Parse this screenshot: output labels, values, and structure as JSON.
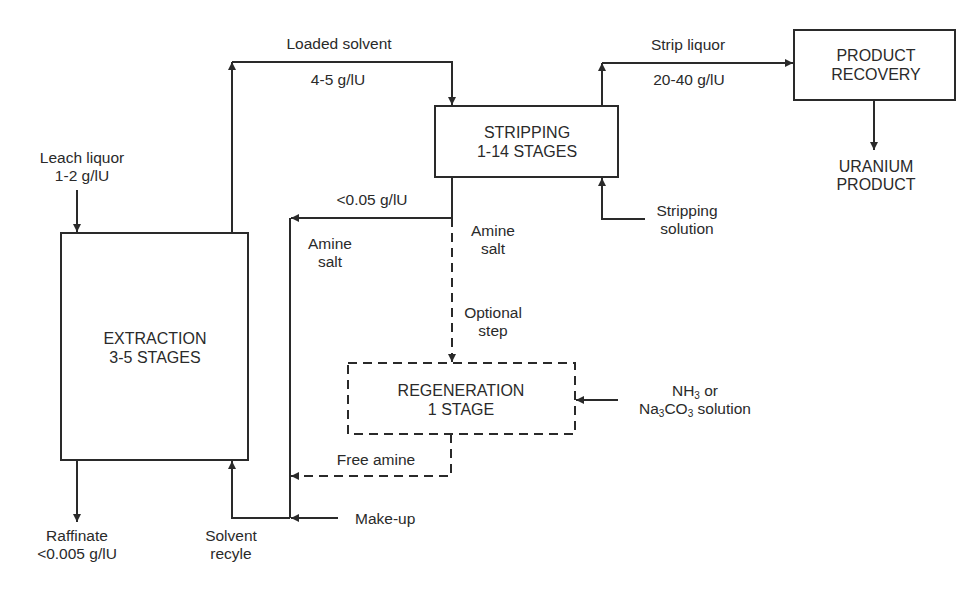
{
  "diagram": {
    "type": "process-flow",
    "colors": {
      "line": "#2a2a2a",
      "background": "#ffffff"
    }
  },
  "boxes": {
    "extraction": {
      "line1": "EXTRACTION",
      "line2": "3-5 STAGES",
      "style": "solid"
    },
    "stripping": {
      "line1": "STRIPPING",
      "line2": "1-14 STAGES",
      "style": "solid"
    },
    "product_recovery": {
      "line1": "PRODUCT",
      "line2": "RECOVERY",
      "style": "solid"
    },
    "regeneration": {
      "line1": "REGENERATION",
      "line2": "1 STAGE",
      "style": "dashed"
    }
  },
  "labels": {
    "leach_liquor": {
      "line1": "Leach liquor",
      "line2": "1-2 g/lU"
    },
    "loaded_solvent": {
      "name": "Loaded solvent",
      "conc": "4-5 g/lU"
    },
    "strip_liquor": {
      "name": "Strip liquor",
      "conc": "20-40 g/lU"
    },
    "uranium_product": {
      "line1": "URANIUM",
      "line2": "PRODUCT"
    },
    "stripping_solution": {
      "line1": "Stripping",
      "line2": "solution"
    },
    "barren_conc": "<0.05 g/lU",
    "amine_salt_left": {
      "line1": "Amine",
      "line2": "salt"
    },
    "amine_salt_right": {
      "line1": "Amine",
      "line2": "salt"
    },
    "optional_step": {
      "line1": "Optional",
      "line2": "step"
    },
    "regen_reagent": {
      "line1_main": "NH",
      "line1_sub": "3",
      "line1_tail": " or",
      "line2_a": "Na",
      "line2_sub1": "3",
      "line2_b": "CO",
      "line2_sub2": "3",
      "line2_tail": " solution"
    },
    "free_amine": "Free amine",
    "make_up": "Make-up",
    "raffinate": {
      "line1": "Raffinate",
      "line2": "<0.005 g/lU"
    },
    "solvent_recycle": {
      "line1": "Solvent",
      "line2": "recyle"
    }
  },
  "flows": [
    {
      "from": "Leach liquor",
      "to": "EXTRACTION",
      "style": "solid"
    },
    {
      "from": "EXTRACTION",
      "to": "STRIPPING",
      "label": "Loaded solvent 4-5 g/lU",
      "style": "solid"
    },
    {
      "from": "STRIPPING",
      "to": "PRODUCT RECOVERY",
      "label": "Strip liquor 20-40 g/lU",
      "style": "solid"
    },
    {
      "from": "PRODUCT RECOVERY",
      "to": "URANIUM PRODUCT",
      "style": "solid"
    },
    {
      "from": "Stripping solution",
      "to": "STRIPPING",
      "style": "solid"
    },
    {
      "from": "STRIPPING",
      "to": "Solvent recycle line",
      "label": "<0.05 g/lU Amine salt",
      "style": "solid"
    },
    {
      "from": "STRIPPING",
      "to": "REGENERATION",
      "label": "Amine salt / Optional step",
      "style": "dashed"
    },
    {
      "from": "NH3 or Na3CO3 solution",
      "to": "REGENERATION",
      "style": "solid"
    },
    {
      "from": "REGENERATION",
      "to": "Solvent recycle line",
      "label": "Free amine",
      "style": "dashed"
    },
    {
      "from": "Make-up",
      "to": "Solvent recycle line",
      "style": "solid"
    },
    {
      "from": "Solvent recycle line",
      "to": "EXTRACTION",
      "label": "Solvent recyle",
      "style": "solid"
    },
    {
      "from": "EXTRACTION",
      "to": "Raffinate",
      "label": "Raffinate <0.005 g/lU",
      "style": "solid"
    }
  ]
}
